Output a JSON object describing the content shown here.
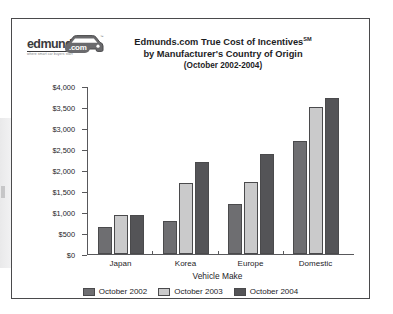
{
  "logo": {
    "wordmark": "edmunds",
    "dotcom": ".com",
    "tagline": "where smart car buyers start",
    "icon": "car-icon"
  },
  "chart_data": {
    "type": "bar",
    "title_line_1": "Edmunds.com True Cost of Incentives",
    "title_superscript": "SM",
    "title_line_2": "by Manufacturer's Country of Origin",
    "title_line_3": "(October 2002-2004)",
    "xlabel": "Vehicle Make",
    "ylabel": "",
    "categories": [
      "Japan",
      "Korea",
      "Europe",
      "Domestic"
    ],
    "series": [
      {
        "name": "October 2002",
        "color": "#6e6e71",
        "values": [
          650,
          780,
          1200,
          2700
        ]
      },
      {
        "name": "October 2003",
        "color": "#cacacb",
        "values": [
          930,
          1680,
          1720,
          3500
        ]
      },
      {
        "name": "October 2004",
        "color": "#545457",
        "values": [
          930,
          2200,
          2370,
          3720
        ]
      }
    ],
    "ylim": [
      0,
      4000
    ],
    "ytick_values": [
      0,
      500,
      1000,
      1500,
      2000,
      2500,
      3000,
      3500,
      4000
    ],
    "ytick_labels": [
      "$0",
      "$500",
      "$1,000",
      "$1,500",
      "$2,000",
      "$2,500",
      "$3,000",
      "$3,500",
      "$4,000"
    ],
    "grid": false,
    "legend_position": "bottom"
  }
}
